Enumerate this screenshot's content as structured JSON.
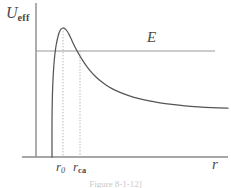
{
  "figure": {
    "caption": "Figure      8-1-12]"
  },
  "labels": {
    "y_axis": "U",
    "y_axis_sub": "eff",
    "x_axis": "r",
    "energy_line": "E",
    "tick_r0": "r",
    "tick_r0_sub": "0",
    "tick_rca": "r",
    "tick_rca_sub": "ca"
  },
  "colors": {
    "curve": "#555555",
    "axis": "#8a8a8a",
    "energy_line": "#9a9a9a",
    "guide_line": "#b9a9a9",
    "text": "#4a4a4a",
    "background": "#ffffff"
  },
  "chart_data": {
    "type": "line",
    "title": "",
    "xlabel": "r",
    "ylabel": "U_eff",
    "grid": false,
    "legend": false,
    "axis_origin_px": {
      "x": 36,
      "y": 157
    },
    "axis_extent_px": {
      "x_max": 228,
      "y_min": 2
    },
    "annotations": [
      {
        "name": "E",
        "type": "horizontal-line",
        "y_px": 51,
        "x_start_px": 36,
        "x_end_px": 215,
        "label": "E"
      },
      {
        "name": "r_0",
        "type": "vertical-dotted",
        "x_px": 63,
        "y_top_px": 28,
        "y_bottom_px": 157,
        "label": "r_0",
        "meaning": "position of potential barrier maximum"
      },
      {
        "name": "r_ca",
        "type": "vertical-dotted",
        "x_px": 80,
        "y_top_px": 51,
        "y_bottom_px": 157,
        "label": "r_ca",
        "meaning": "turning radius where U_eff equals E"
      }
    ],
    "curve_description": "Effective potential of a centrifugal barrier: rises near-vertically from the axis, peaks above the energy level E, then decays asymptotically toward a constant below E.",
    "curve_points_px": [
      [
        52,
        157
      ],
      [
        52,
        120
      ],
      [
        52.4,
        96
      ],
      [
        53,
        80
      ],
      [
        53.8,
        66
      ],
      [
        54.8,
        55
      ],
      [
        56,
        46
      ],
      [
        57.4,
        39
      ],
      [
        59,
        33
      ],
      [
        61,
        29.2
      ],
      [
        63,
        28
      ],
      [
        65,
        28.8
      ],
      [
        67,
        31
      ],
      [
        69,
        34.4
      ],
      [
        71,
        38.6
      ],
      [
        73.5,
        44
      ],
      [
        76,
        49
      ],
      [
        79,
        54.4
      ],
      [
        82,
        59.4
      ],
      [
        86,
        65.4
      ],
      [
        90,
        70.6
      ],
      [
        95,
        76
      ],
      [
        100,
        80.6
      ],
      [
        106,
        85
      ],
      [
        112,
        88.6
      ],
      [
        120,
        92.4
      ],
      [
        128,
        95.4
      ],
      [
        138,
        98.4
      ],
      [
        148,
        100.6
      ],
      [
        160,
        102.8
      ],
      [
        172,
        104.4
      ],
      [
        185,
        105.8
      ],
      [
        198,
        106.8
      ],
      [
        212,
        107.6
      ],
      [
        228,
        108.2
      ]
    ],
    "series": [
      {
        "name": "U_eff(r)",
        "description": "effective potential curve"
      }
    ]
  }
}
